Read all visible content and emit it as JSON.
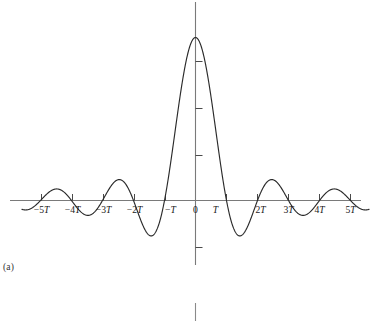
{
  "figure": {
    "panel_label": "(a)",
    "colors": {
      "curve": "#2b2b2b",
      "axis": "#7a7a7a",
      "tick": "#4a4a4a",
      "background": "#ffffff",
      "text": "#1a1a1a"
    }
  },
  "chart_data": {
    "type": "line",
    "title": "",
    "subtitle": "",
    "xlabel": "",
    "ylabel": "",
    "function": "sinc",
    "grid": false,
    "legend": false,
    "xlim": [
      -5.6,
      5.6
    ],
    "ylim": [
      -0.28,
      1.12
    ],
    "x_tick_values": [
      -5,
      -4,
      -3,
      -2,
      -1,
      0,
      1,
      2,
      3,
      4,
      5
    ],
    "x_tick_labels": [
      "−5T",
      "−4T",
      "−3T",
      "−2T",
      "−T",
      "0",
      "T",
      "2T",
      "3T",
      "4T",
      "5T"
    ],
    "y_tick_values": [
      0.25,
      0.5,
      0.75,
      -0.25
    ],
    "y_tick_labels": [
      "",
      "",
      "",
      ""
    ],
    "annotations": [
      "(a)"
    ],
    "x": [
      -5.6,
      -5.4,
      -5.2,
      -5.0,
      -4.8,
      -4.6,
      -4.4,
      -4.2,
      -4.0,
      -3.8,
      -3.6,
      -3.4,
      -3.2,
      -3.0,
      -2.8,
      -2.6,
      -2.4,
      -2.2,
      -2.0,
      -1.8,
      -1.6,
      -1.4,
      -1.2,
      -1.0,
      -0.9,
      -0.8,
      -0.7,
      -0.6,
      -0.5,
      -0.4,
      -0.3,
      -0.2,
      -0.1,
      0.0,
      0.1,
      0.2,
      0.3,
      0.4,
      0.5,
      0.6,
      0.7,
      0.8,
      0.9,
      1.0,
      1.2,
      1.4,
      1.6,
      1.8,
      2.0,
      2.2,
      2.4,
      2.6,
      2.8,
      3.0,
      3.2,
      3.4,
      3.6,
      3.8,
      4.0,
      4.2,
      4.4,
      4.6,
      4.8,
      5.0,
      5.2,
      5.4,
      5.6
    ],
    "y": [
      -0.054,
      -0.068,
      -0.059,
      0.0,
      0.059,
      0.068,
      0.054,
      0.0,
      0.0,
      -0.047,
      -0.078,
      -0.086,
      -0.063,
      0.0,
      0.068,
      0.108,
      0.116,
      0.084,
      0.0,
      -0.104,
      -0.189,
      -0.216,
      -0.156,
      0.0,
      0.109,
      0.234,
      0.368,
      0.505,
      0.637,
      0.757,
      0.858,
      0.935,
      0.984,
      1.0,
      0.984,
      0.935,
      0.858,
      0.757,
      0.637,
      0.505,
      0.368,
      0.234,
      0.109,
      0.0,
      -0.156,
      -0.216,
      -0.189,
      -0.104,
      0.0,
      0.084,
      0.116,
      0.108,
      0.068,
      0.0,
      -0.063,
      -0.086,
      -0.078,
      -0.047,
      0.0,
      0.054,
      0.068,
      0.059,
      0.0,
      -0.059,
      -0.068,
      -0.054,
      0.0
    ]
  }
}
